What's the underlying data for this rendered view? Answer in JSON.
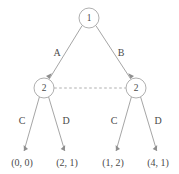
{
  "diagram": {
    "type": "game-tree",
    "title": "",
    "colors": {
      "background": "#ffffff",
      "edge": "#8e8e8e",
      "node_stroke": "#9a9a9a",
      "node_fill": "#ffffff",
      "text": "#4a4a4a",
      "info_set_link": "#9a9a9a"
    },
    "nodes": [
      {
        "id": "root",
        "label": "1",
        "player": "1",
        "x": 89,
        "y": 18,
        "r": 10
      },
      {
        "id": "left",
        "label": "2",
        "player": "2",
        "x": 44,
        "y": 88,
        "r": 10
      },
      {
        "id": "right",
        "label": "2",
        "player": "2",
        "x": 136,
        "y": 88,
        "r": 10
      }
    ],
    "edges": [
      {
        "id": "root-left",
        "from": "root",
        "to": "left",
        "label": "A",
        "label_x": 57,
        "label_y": 54
      },
      {
        "id": "root-right",
        "from": "root",
        "to": "right",
        "label": "B",
        "label_x": 121,
        "label_y": 54
      },
      {
        "id": "left-leaf1",
        "from": "left",
        "to": "leaf1",
        "label": "C",
        "label_x": 22,
        "label_y": 122
      },
      {
        "id": "left-leaf2",
        "from": "left",
        "to": "leaf2",
        "label": "D",
        "label_x": 66,
        "label_y": 122
      },
      {
        "id": "right-leaf3",
        "from": "right",
        "to": "leaf3",
        "label": "C",
        "label_x": 114,
        "label_y": 122
      },
      {
        "id": "right-leaf4",
        "from": "right",
        "to": "leaf4",
        "label": "D",
        "label_x": 158,
        "label_y": 122
      }
    ],
    "leaves": [
      {
        "id": "leaf1",
        "label": "(0, 0)",
        "payoffs": [
          0,
          0
        ],
        "x": 22,
        "y": 164
      },
      {
        "id": "leaf2",
        "label": "(2, 1)",
        "payoffs": [
          2,
          1
        ],
        "x": 67,
        "y": 164
      },
      {
        "id": "leaf3",
        "label": "(1, 2)",
        "payoffs": [
          1,
          2
        ],
        "x": 113,
        "y": 164
      },
      {
        "id": "leaf4",
        "label": "(4, 1)",
        "payoffs": [
          4,
          1
        ],
        "x": 158,
        "y": 164
      }
    ],
    "information_set": {
      "id": "infoset-player2",
      "connects": [
        "left",
        "right"
      ],
      "style": "dashed",
      "y": 88,
      "x1": 54,
      "x2": 126
    }
  }
}
